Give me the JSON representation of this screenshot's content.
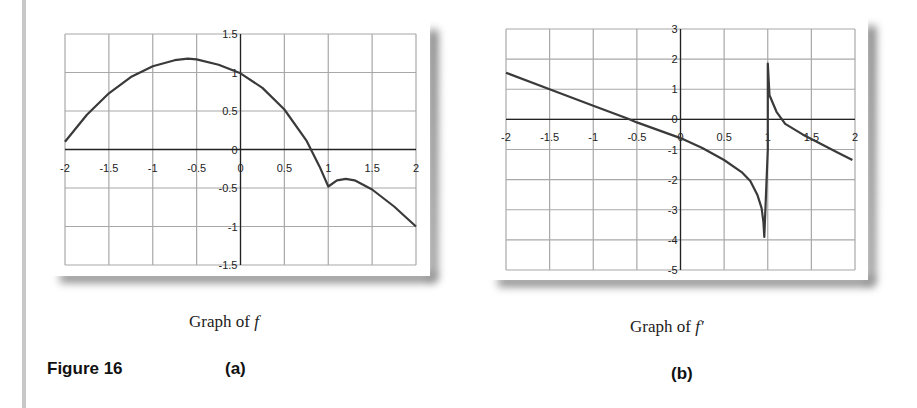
{
  "figure": {
    "label": "Figure 16",
    "sub_a": "(a)",
    "sub_b": "(b)",
    "caption_a_prefix": "Graph of",
    "caption_a_symbol": "f",
    "caption_b_prefix": "Graph of",
    "caption_b_symbol": "f′"
  },
  "colors": {
    "grid": "#a8a8a8",
    "axis": "#222222",
    "curve": "#3a3a3a",
    "text": "#222222"
  },
  "chart_data": [
    {
      "id": "a",
      "type": "line",
      "title": "Graph of f",
      "xlabel": "",
      "ylabel": "",
      "xlim": [
        -2,
        2
      ],
      "ylim": [
        -1.5,
        1.5
      ],
      "grid": true,
      "legend": "none",
      "x_ticks": [
        -2,
        -1.5,
        -1,
        -0.5,
        0,
        0.5,
        1,
        1.5,
        2
      ],
      "x_tick_labels": [
        "-2",
        "-1.5",
        "-1",
        "-0.5",
        "0",
        "0.5",
        "1",
        "1.5",
        "2"
      ],
      "y_ticks": [
        1.5,
        1,
        0.5,
        0,
        -0.5,
        -1,
        -1.5
      ],
      "y_tick_labels": [
        "1.5",
        "1",
        "0.5",
        "0",
        "-0.5",
        "-1",
        "-1.5"
      ],
      "series": [
        {
          "name": "f",
          "x": [
            -2,
            -1.75,
            -1.5,
            -1.25,
            -1,
            -0.75,
            -0.6,
            -0.5,
            -0.25,
            0,
            0.25,
            0.5,
            0.75,
            0.9,
            1.0,
            1.1,
            1.2,
            1.3,
            1.5,
            1.75,
            2
          ],
          "y": [
            0.1,
            0.45,
            0.73,
            0.94,
            1.08,
            1.16,
            1.18,
            1.17,
            1.1,
            0.99,
            0.8,
            0.52,
            0.12,
            -0.22,
            -0.48,
            -0.4,
            -0.38,
            -0.4,
            -0.52,
            -0.74,
            -1.0
          ]
        }
      ]
    },
    {
      "id": "b",
      "type": "line",
      "title": "Graph of f′",
      "xlabel": "",
      "ylabel": "",
      "xlim": [
        -2,
        2
      ],
      "ylim": [
        -5,
        3
      ],
      "grid": true,
      "legend": "none",
      "x_ticks": [
        -2,
        -1.5,
        -1,
        -0.5,
        0,
        0.5,
        1,
        1.5,
        2
      ],
      "x_tick_labels": [
        "-2",
        "-1.5",
        "-1",
        "-0.5",
        "0",
        "0.5",
        "1",
        "1.5",
        "2"
      ],
      "y_ticks": [
        3,
        2,
        1,
        0,
        -1,
        -2,
        -3,
        -4,
        -5
      ],
      "y_tick_labels": [
        "3",
        "2",
        "1",
        "0",
        "-1",
        "-2",
        "-3",
        "-4",
        "-5"
      ],
      "series": [
        {
          "name": "f'",
          "x": [
            -2,
            -1.5,
            -1,
            -0.6,
            -0.5,
            0,
            0.25,
            0.5,
            0.7,
            0.8,
            0.88,
            0.93,
            0.95,
            0.96,
            0.96,
            1.0,
            1.0,
            1.02,
            1.1,
            1.2,
            1.4,
            1.6,
            1.8,
            1.97
          ],
          "y": [
            1.55,
            1.0,
            0.45,
            0.02,
            -0.1,
            -0.62,
            -0.95,
            -1.35,
            -1.75,
            -2.05,
            -2.5,
            -2.95,
            -3.4,
            -3.9,
            -3.9,
            -1.0,
            1.85,
            0.8,
            0.25,
            -0.15,
            -0.5,
            -0.8,
            -1.1,
            -1.35
          ]
        }
      ]
    }
  ]
}
